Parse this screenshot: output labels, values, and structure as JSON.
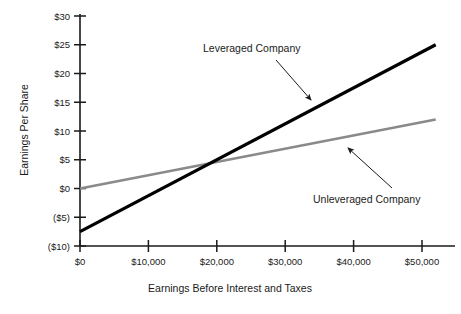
{
  "chart_data": {
    "type": "line",
    "title": "",
    "xlabel": "Earnings Before Interest and Taxes",
    "ylabel": "Earnings Per Share",
    "xlim": [
      0,
      52000
    ],
    "ylim": [
      -10,
      30
    ],
    "grid": false,
    "legend_position": "none",
    "x_ticks": [
      0,
      10000,
      20000,
      30000,
      40000,
      50000
    ],
    "x_tick_labels": [
      "$0",
      "$10,000",
      "$20,000",
      "$30,000",
      "$40,000",
      "$50,000"
    ],
    "y_ticks": [
      -10,
      -5,
      0,
      5,
      10,
      15,
      20,
      25,
      30
    ],
    "y_tick_labels": [
      "($10)",
      "($5)",
      "$0",
      "$5",
      "$10",
      "$15",
      "$20",
      "$25",
      "$30"
    ],
    "series": [
      {
        "name": "Leveraged Company",
        "color": "#000000",
        "width": 3.2,
        "x": [
          0,
          52000
        ],
        "values": [
          -7.5,
          25.0
        ]
      },
      {
        "name": "Unleveraged Company",
        "color": "#8a8a8a",
        "width": 2.6,
        "x": [
          0,
          52000
        ],
        "values": [
          0.0,
          12.0
        ]
      }
    ],
    "annotations": [
      {
        "text": "Leveraged Company",
        "text_x": 203,
        "text_y": 52,
        "arrow_from_x": 276,
        "arrow_from_y": 60,
        "arrow_to_x": 315,
        "arrow_to_y": 104
      },
      {
        "text": "Unleveraged Company",
        "text_x": 313,
        "text_y": 200,
        "arrow_from_x": 392,
        "arrow_from_y": 188,
        "arrow_to_x": 345,
        "arrow_to_y": 145
      }
    ]
  },
  "axes": {
    "y_axis_title": "Earnings Per Share",
    "x_axis_title": "Earnings Before Interest and Taxes"
  }
}
